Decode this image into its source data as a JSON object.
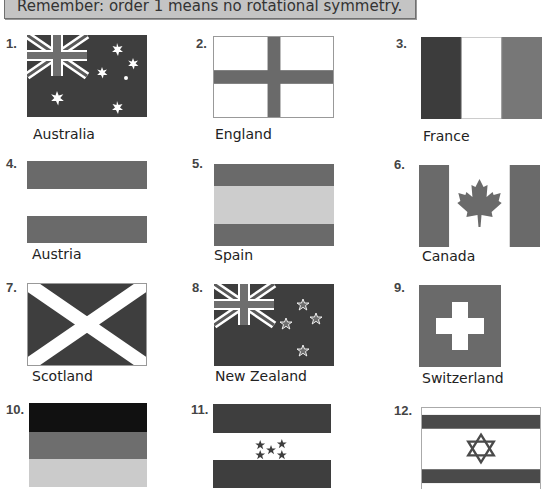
{
  "header": {
    "text": "Remember: order 1 means no rotational symmetry."
  },
  "flags": [
    {
      "number": "1.",
      "name": "Australia"
    },
    {
      "number": "2.",
      "name": "England"
    },
    {
      "number": "3.",
      "name": "France"
    },
    {
      "number": "4.",
      "name": "Austria"
    },
    {
      "number": "5.",
      "name": "Spain"
    },
    {
      "number": "6.",
      "name": "Canada"
    },
    {
      "number": "7.",
      "name": "Scotland"
    },
    {
      "number": "8.",
      "name": "New Zealand"
    },
    {
      "number": "9.",
      "name": "Switzerland"
    },
    {
      "number": "10.",
      "name": ""
    },
    {
      "number": "11.",
      "name": ""
    },
    {
      "number": "12.",
      "name": ""
    }
  ],
  "colors": {
    "dark": "#3c3c3c",
    "mid": "#6e6e6e",
    "light": "#c8c8c8",
    "black": "#111111",
    "white": "#ffffff",
    "header_bg": "#c4c4c4"
  }
}
